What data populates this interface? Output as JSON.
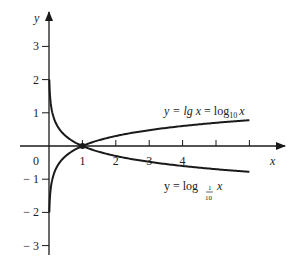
{
  "chart_data": {
    "type": "line",
    "title": "",
    "xlabel": "x",
    "ylabel": "y",
    "origin_label": "0",
    "xlim": [
      0,
      7
    ],
    "ylim": [
      -3.3,
      4
    ],
    "x_ticks": [
      1,
      2,
      3,
      4,
      5,
      6
    ],
    "x_tick_labels": [
      "1",
      "2",
      "3",
      "4"
    ],
    "y_ticks": [
      3,
      2,
      1,
      -1,
      -2,
      -3
    ],
    "y_tick_labels": [
      "3",
      "2",
      "1",
      "− 1",
      "− 2",
      "− 3"
    ],
    "grid": false,
    "legend": "inline annotations",
    "series": [
      {
        "name": "y = lg x = log10 x",
        "label_parts": {
          "prefix": "y = lg ",
          "var1": "x",
          "mid": " = log",
          "sub": "10",
          "var2": "x"
        },
        "function": "log10(x)",
        "x": [
          0.01,
          0.1,
          0.5,
          1,
          2,
          3,
          4,
          5,
          6
        ],
        "values": [
          -2,
          -1,
          -0.301,
          0,
          0.301,
          0.477,
          0.602,
          0.699,
          0.778
        ]
      },
      {
        "name": "y = log_{1/10} x",
        "label_parts": {
          "prefix": "y = log ",
          "sub_num": "1",
          "sub_den": "10",
          "var": "x"
        },
        "function": "-log10(x)",
        "x": [
          0.01,
          0.1,
          0.5,
          1,
          2,
          3,
          4,
          5,
          6
        ],
        "values": [
          2,
          1,
          0.301,
          0,
          -0.301,
          -0.477,
          -0.602,
          -0.699,
          -0.778
        ]
      }
    ],
    "annotations": [
      {
        "text": "intersection point",
        "x": 1,
        "y": 0,
        "marker": "dot"
      }
    ]
  },
  "colors": {
    "axis": "#1a1a1a",
    "curve": "#1a1a1a",
    "text": "#222222",
    "background": "#ffffff"
  }
}
